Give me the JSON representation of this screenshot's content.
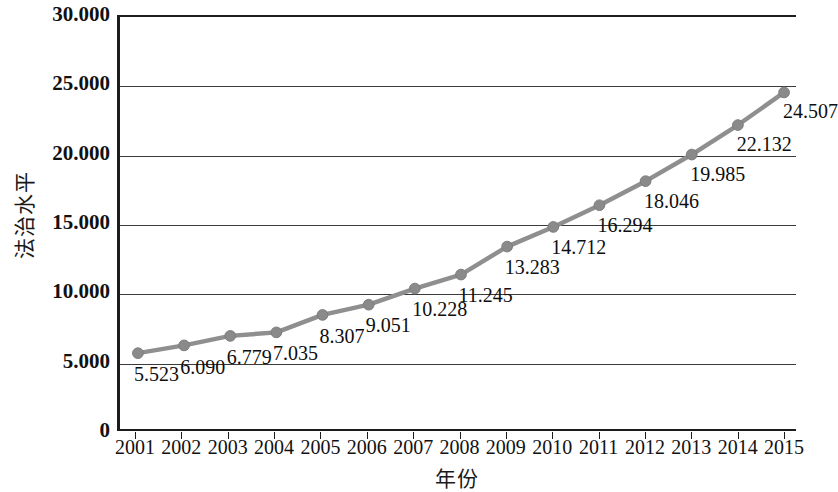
{
  "chart_data": {
    "type": "line",
    "title": "",
    "xlabel": "年份",
    "ylabel": "法治水平",
    "categories": [
      "2001",
      "2002",
      "2003",
      "2004",
      "2005",
      "2006",
      "2007",
      "2008",
      "2009",
      "2010",
      "2011",
      "2012",
      "2013",
      "2014",
      "2015"
    ],
    "values": [
      5.523,
      6.09,
      6.779,
      7.035,
      8.307,
      9.051,
      10.228,
      11.245,
      13.283,
      14.712,
      16.294,
      18.046,
      19.985,
      22.132,
      24.507
    ],
    "value_labels": [
      "5.523",
      "6.090",
      "6.779",
      "7.035",
      "8.307",
      "9.051",
      "10.228",
      "11.245",
      "13.283",
      "14.712",
      "16.294",
      "18.046",
      "19.985",
      "22.132",
      "24.507"
    ],
    "ylim": [
      0,
      30
    ],
    "y_ticks": [
      0,
      5,
      10,
      15,
      20,
      25,
      30
    ],
    "y_tick_labels": [
      "0",
      "5.000",
      "10.000",
      "15.000",
      "20.000",
      "25.000",
      "30.000"
    ],
    "grid": true,
    "grid_axis": "y",
    "legend": "none",
    "series_color": "#8f8f8f",
    "marker": "circle",
    "marker_color": "#8a8a8a",
    "axis_color": "#1d1d1d",
    "gridline_color": "#3a3a3a",
    "background": "#ffffff",
    "series": [
      {
        "name": "法治水平",
        "values": [
          5.523,
          6.09,
          6.779,
          7.035,
          8.307,
          9.051,
          10.228,
          11.245,
          13.283,
          14.712,
          16.294,
          18.046,
          19.985,
          22.132,
          24.507
        ]
      }
    ]
  }
}
